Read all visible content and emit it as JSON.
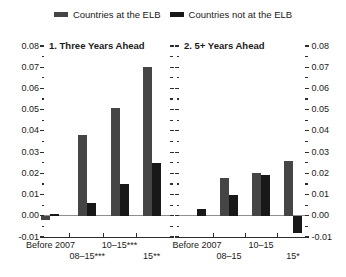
{
  "figure": {
    "legend": [
      {
        "label": "Countries at the ELB",
        "color": "#454545"
      },
      {
        "label": "Countries not at the ELB",
        "color": "#181818"
      }
    ]
  },
  "chart_data": [
    {
      "type": "bar",
      "title": "1. Three Years Ahead",
      "categories": [
        "Before 2007",
        "08–15***",
        "10–15***",
        "15**"
      ],
      "series": [
        {
          "name": "Countries at the ELB",
          "color": "#454545",
          "values": [
            -0.002,
            0.038,
            0.051,
            0.07
          ]
        },
        {
          "name": "Countries not at the ELB",
          "color": "#181818",
          "values": [
            0.001,
            0.006,
            0.015,
            0.025
          ]
        }
      ],
      "ylim": [
        -0.01,
        0.08
      ],
      "ytick_step": 0.01,
      "yminor_step": 0.005,
      "axis_label_side": "left",
      "grid": false,
      "legend_position": "top",
      "group_centers_frac": [
        0.044,
        0.341,
        0.601,
        0.86
      ]
    },
    {
      "type": "bar",
      "title": "2. 5+ Years Ahead",
      "categories": [
        "Before 2007",
        "08–15",
        "10–15",
        "15*"
      ],
      "series": [
        {
          "name": "Countries at the ELB",
          "color": "#454545",
          "values": [
            0.0,
            0.018,
            0.02,
            0.026
          ]
        },
        {
          "name": "Countries not at the ELB",
          "color": "#181818",
          "values": [
            0.003,
            0.01,
            0.019,
            -0.008
          ]
        }
      ],
      "ylim": [
        -0.01,
        0.08
      ],
      "ytick_step": 0.01,
      "yminor_step": 0.005,
      "axis_label_side": "right",
      "grid": false,
      "legend_position": "top",
      "group_centers_frac": [
        0.137,
        0.395,
        0.653,
        0.911
      ]
    }
  ]
}
